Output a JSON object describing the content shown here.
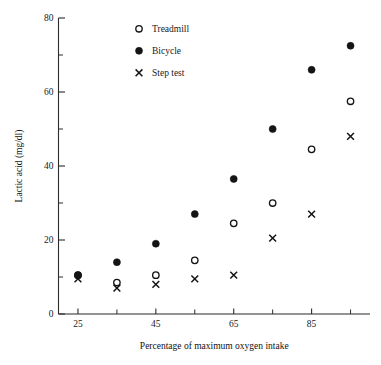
{
  "chart_data": {
    "type": "scatter",
    "title": "",
    "xlabel": "Percentage of maximum oxygen intake",
    "ylabel": "Lactic acid (mg/dl)",
    "xlim": [
      20,
      100
    ],
    "ylim": [
      0,
      80
    ],
    "grid": false,
    "legend_position": "top-left-inside",
    "x_major_ticks": [
      25,
      45,
      65,
      85
    ],
    "x_minor_ticks": [
      35,
      55,
      75,
      95
    ],
    "x_tick_labels": [
      "25",
      "45",
      "65",
      "85"
    ],
    "y_major_ticks": [
      0,
      20,
      40,
      60,
      80
    ],
    "y_minor_ticks": [
      10,
      30,
      50,
      70
    ],
    "y_tick_labels": [
      "0",
      "20",
      "40",
      "60",
      "80"
    ],
    "x": [
      25,
      35,
      45,
      55,
      65,
      75,
      85,
      95
    ],
    "series": [
      {
        "name": "Treadmill",
        "marker": "open-circle",
        "color": "#141414",
        "values": [
          10.5,
          8.5,
          10.5,
          14.5,
          24.5,
          30,
          44.5,
          57.5
        ]
      },
      {
        "name": "Bicycle",
        "marker": "filled-circle",
        "color": "#141414",
        "values": [
          10.5,
          14,
          19,
          27,
          36.5,
          50,
          66,
          72.5
        ]
      },
      {
        "name": "Step test",
        "marker": "cross",
        "color": "#141414",
        "values": [
          9.5,
          7,
          8,
          9.5,
          10.5,
          20.5,
          27,
          48
        ]
      }
    ]
  },
  "legend": {
    "items": [
      {
        "label": "Treadmill",
        "marker": "open-circle"
      },
      {
        "label": "Bicycle",
        "marker": "filled-circle"
      },
      {
        "label": "Step test",
        "marker": "cross"
      }
    ]
  }
}
